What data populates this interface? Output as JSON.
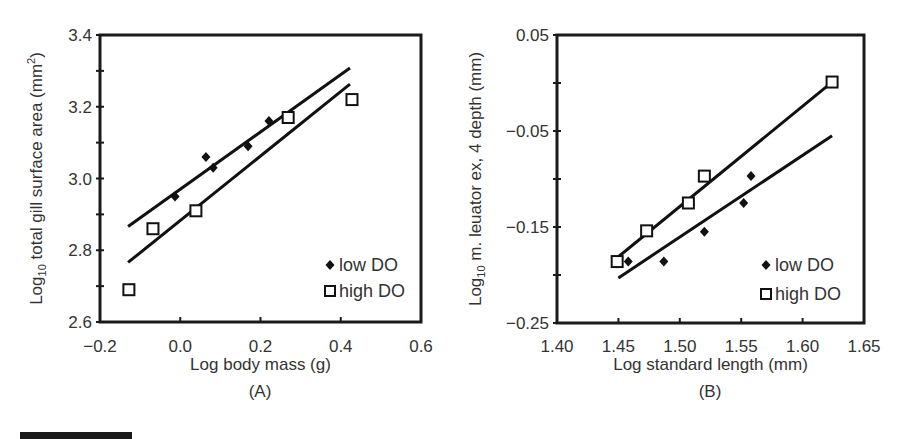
{
  "figure": {
    "panels": [
      "(A)",
      "(B)"
    ],
    "legend": {
      "low": "low DO",
      "high": "high DO"
    }
  },
  "chart_data": [
    {
      "type": "scatter",
      "panel_label": "(A)",
      "title": "",
      "xlabel": "Log body mass (g)",
      "ylabel": "Log10 total gill surface area (mm2)",
      "ylabel_parts": {
        "prefix": "Log",
        "sub": "10",
        "main": " total gill surface area (mm",
        "sup": "2",
        "suffix": ")"
      },
      "xlim": [
        -0.2,
        0.6
      ],
      "ylim": [
        2.6,
        3.4
      ],
      "xticks": [
        -0.2,
        0.0,
        0.2,
        0.4,
        0.6
      ],
      "xtick_labels": [
        "−0.2",
        "0.0",
        "0.2",
        "0.4",
        "0.6"
      ],
      "yticks": [
        2.6,
        2.8,
        3.0,
        3.2,
        3.4
      ],
      "ytick_labels": [
        "2.6",
        "2.8",
        "3.0",
        "3.2",
        "3.4"
      ],
      "y_minor_ticks": [
        2.7,
        2.9,
        3.1,
        3.3
      ],
      "grid": false,
      "legend_position": "lower right",
      "series": [
        {
          "name": "low DO",
          "marker": "diamond-filled",
          "points": [
            {
              "x": -0.013,
              "y": 2.95
            },
            {
              "x": 0.064,
              "y": 3.06
            },
            {
              "x": 0.082,
              "y": 3.03
            },
            {
              "x": 0.169,
              "y": 3.09
            },
            {
              "x": 0.221,
              "y": 3.16
            }
          ],
          "fit_line": {
            "x": [
              -0.13,
              0.423
            ],
            "y": [
              2.866,
              3.308
            ]
          }
        },
        {
          "name": "high DO",
          "marker": "square-open",
          "points": [
            {
              "x": -0.128,
              "y": 2.69
            },
            {
              "x": -0.068,
              "y": 2.86
            },
            {
              "x": 0.039,
              "y": 2.91
            },
            {
              "x": 0.269,
              "y": 3.17
            },
            {
              "x": 0.428,
              "y": 3.22
            }
          ],
          "fit_line": {
            "x": [
              -0.13,
              0.423
            ],
            "y": [
              2.766,
              3.263
            ]
          }
        }
      ]
    },
    {
      "type": "scatter",
      "panel_label": "(B)",
      "title": "",
      "xlabel": "Log standard length (mm)",
      "ylabel": "Log10 m. leuator ex, 4 depth (mm)",
      "ylabel_parts": {
        "prefix": "Log",
        "sub": "10",
        "main": " m. leuator ex, 4 depth (mm)"
      },
      "xlim": [
        1.4,
        1.65
      ],
      "ylim": [
        -0.25,
        0.05
      ],
      "xticks": [
        1.4,
        1.45,
        1.5,
        1.55,
        1.6,
        1.65
      ],
      "xtick_labels": [
        "1.40",
        "1.45",
        "1.50",
        "1.55",
        "1.60",
        "1.65"
      ],
      "yticks": [
        -0.25,
        -0.15,
        -0.05,
        0.05
      ],
      "ytick_labels": [
        "−0.25",
        "−0.15",
        "−0.05",
        "0.05"
      ],
      "y_minor_ticks": [
        -0.2,
        -0.1,
        0.0
      ],
      "grid": false,
      "legend_position": "lower right",
      "series": [
        {
          "name": "low DO",
          "marker": "diamond-filled",
          "points": [
            {
              "x": 1.458,
              "y": -0.186
            },
            {
              "x": 1.487,
              "y": -0.186
            },
            {
              "x": 1.52,
              "y": -0.155
            },
            {
              "x": 1.552,
              "y": -0.125
            },
            {
              "x": 1.558,
              "y": -0.097
            }
          ],
          "fit_line": {
            "x": [
              1.45,
              1.624
            ],
            "y": [
              -0.203,
              -0.055
            ]
          }
        },
        {
          "name": "high DO",
          "marker": "square-open",
          "points": [
            {
              "x": 1.449,
              "y": -0.186
            },
            {
              "x": 1.473,
              "y": -0.154
            },
            {
              "x": 1.507,
              "y": -0.125
            },
            {
              "x": 1.52,
              "y": -0.097
            },
            {
              "x": 1.624,
              "y": 0.001
            }
          ],
          "fit_line": {
            "x": [
              1.45,
              1.624
            ],
            "y": [
              -0.181,
              0.001
            ]
          }
        }
      ]
    }
  ]
}
